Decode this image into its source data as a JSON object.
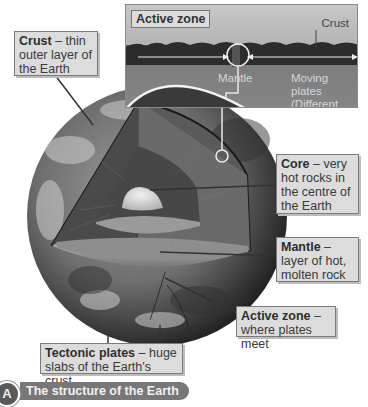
{
  "inset": {
    "title": "Active zone",
    "crust_label": "Crust",
    "mantle_label": "Mantle",
    "moving_plates_label": "Moving plates (Different plates move in different directions)"
  },
  "labels": {
    "crust": {
      "term": "Crust",
      "desc": " – thin outer layer of the Earth"
    },
    "core": {
      "term": "Core",
      "desc": " – very hot rocks in the centre of the Earth"
    },
    "mantle": {
      "term": "Mantle",
      "desc": " – layer of hot, molten rock"
    },
    "active_zone": {
      "term": "Active zone",
      "desc": " – where plates meet"
    },
    "tectonic_plates": {
      "term": "Tectonic plates",
      "desc": " – huge slabs of the Earth's crust"
    }
  },
  "caption": {
    "badge": "A",
    "text": "The structure of the Earth"
  },
  "colors": {
    "box_bg": "#dcdcdc",
    "caption_bg": "#777777",
    "globe_dark": "#2a2a2a"
  }
}
